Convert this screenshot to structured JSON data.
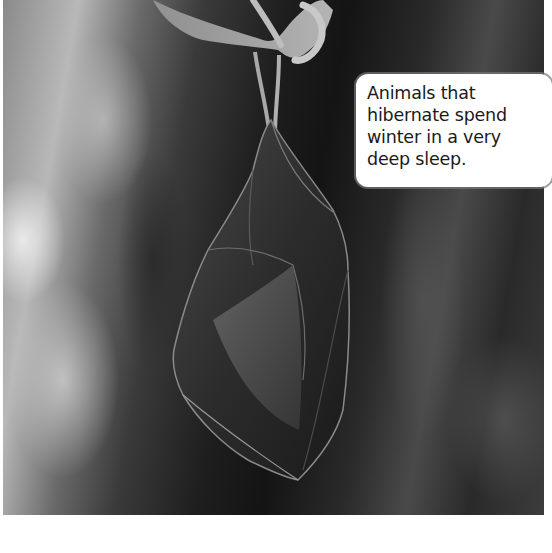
{
  "photo": {
    "subject": "hibernating bat hanging upside down in a cave",
    "style": "grayscale photograph"
  },
  "caption": {
    "lines": [
      "Animals that",
      "hibernate spend",
      "winter in a very",
      "deep sleep."
    ],
    "text": "Animals that\nhibernate spend\nwinter in a very\ndeep sleep."
  },
  "colors": {
    "caption_background": "#ffffff",
    "caption_text": "#1a1a1a",
    "page_background": "#ffffff"
  }
}
